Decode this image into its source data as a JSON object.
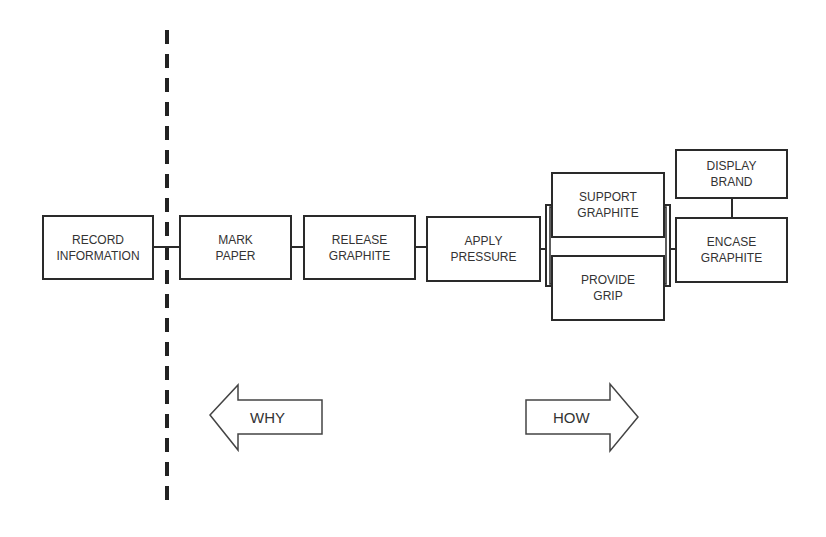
{
  "diagram": {
    "type": "FAST function analysis diagram",
    "boxes": [
      {
        "id": "record",
        "label": "RECORD\nINFORMATION"
      },
      {
        "id": "mark",
        "label": "MARK\nPAPER"
      },
      {
        "id": "release",
        "label": "RELEASE\nGRAPHITE"
      },
      {
        "id": "apply",
        "label": "APPLY\nPRESSURE"
      },
      {
        "id": "support",
        "label": "SUPPORT\nGRAPHITE"
      },
      {
        "id": "grip",
        "label": "PROVIDE\nGRIP"
      },
      {
        "id": "display",
        "label": "DISPLAY\nBRAND"
      },
      {
        "id": "encase",
        "label": "ENCASE\nGRAPHITE"
      }
    ],
    "arrows": {
      "why": "WHY",
      "how": "HOW"
    },
    "colors": {
      "line": "#2a2a2a",
      "text": "#333333",
      "background": "#ffffff"
    }
  }
}
